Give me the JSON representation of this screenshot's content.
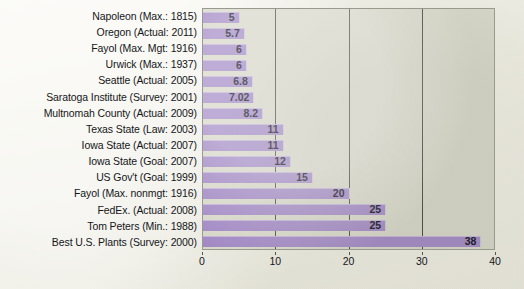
{
  "chart_data": {
    "type": "bar",
    "orientation": "horizontal",
    "title": "",
    "subtitle": "",
    "xlabel": "",
    "ylabel": "",
    "xlim": [
      0,
      40
    ],
    "grid": true,
    "legend": false,
    "xticks": [
      "0",
      "10",
      "20",
      "30",
      "40"
    ],
    "xtick_values": [
      0,
      10,
      20,
      30,
      40
    ],
    "categories": [
      "Napoleon (Max.: 1815)",
      "Oregon (Actual: 2011)",
      "Fayol (Max. Mgt: 1916)",
      "Urwick (Max.: 1937)",
      "Seattle (Actual: 2005)",
      "Saratoga Institute (Survey: 2001)",
      "Multnomah County (Actual: 2009)",
      "Texas State (Law: 2003)",
      "Iowa State (Actual: 2007)",
      "Iowa State (Goal: 2007)",
      "US Gov't (Goal: 1999)",
      "Fayol (Max. nonmgt: 1916)",
      "FedEx. (Actual: 2008)",
      "Tom Peters (Min.: 1988)",
      "Best U.S. Plants (Survey: 2000)"
    ],
    "values": [
      5,
      5.7,
      6,
      6,
      6.8,
      7.02,
      8.2,
      11,
      11,
      12,
      15,
      20,
      25,
      25,
      38
    ],
    "value_labels": [
      "5",
      "5.7",
      "6",
      "6",
      "6.8",
      "7.02",
      "8.2",
      "11",
      "11",
      "12",
      "15",
      "20",
      "25",
      "25",
      "38"
    ],
    "bar_color": "#a289c4",
    "plot_background": "#d6d6c8",
    "page_background": "#f2f1ea",
    "grid_color": "#4a4a42",
    "label_color": "#15161a",
    "value_label_color": "#12121e"
  }
}
